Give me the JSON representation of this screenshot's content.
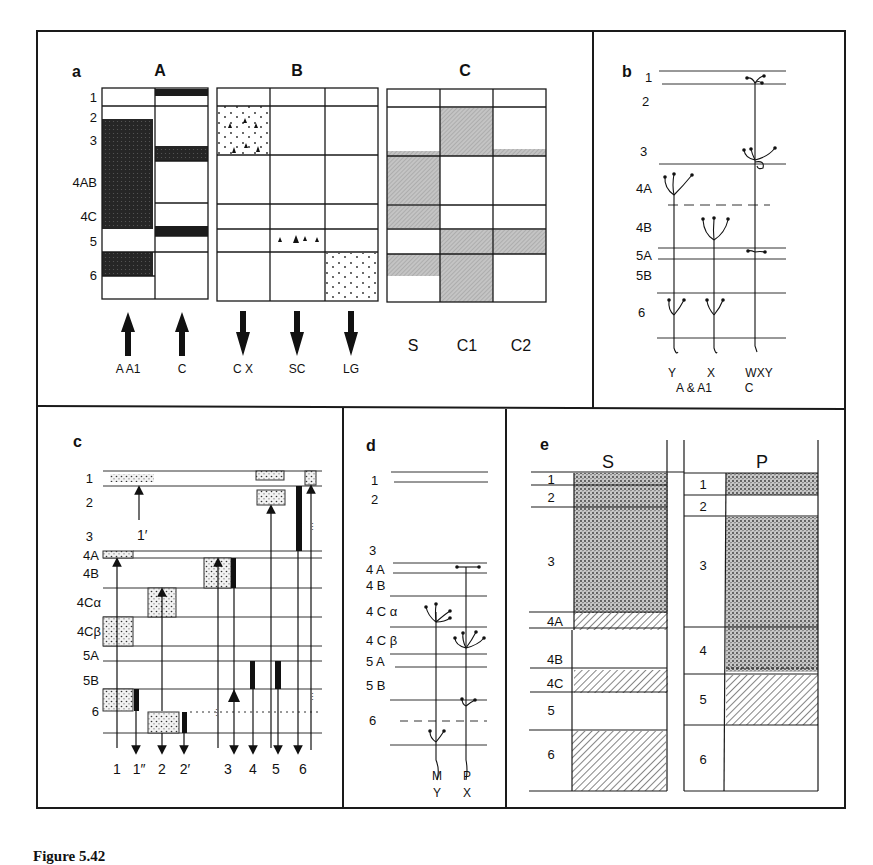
{
  "figure": {
    "caption": "Figure 5.42",
    "stroke_color": "#1a1a1a",
    "dark_fill": "#1c1c1c",
    "grey_fill": "#b8b8b8",
    "stipple_fill": "#e6e6e6"
  },
  "panel_a": {
    "letter": "a",
    "groups": [
      {
        "title": "A",
        "columns": [
          "A A1",
          "C"
        ],
        "arrow": "up"
      },
      {
        "title": "B",
        "columns": [
          "C X",
          "SC",
          "LG"
        ],
        "arrow": "down"
      },
      {
        "title": "C",
        "columns": [
          "S",
          "C1",
          "C2"
        ],
        "arrow": "none"
      }
    ],
    "layers": [
      "1",
      "2",
      "3",
      "4AB",
      "4C",
      "5",
      "6"
    ],
    "arrow_labels": {
      "A": [
        "A A1",
        "C"
      ],
      "B": [
        "C X",
        "SC",
        "LG"
      ],
      "C": [
        "S",
        "C1",
        "C2"
      ]
    }
  },
  "panel_b": {
    "letter": "b",
    "layers": [
      "1",
      "2",
      "3",
      "4A",
      "4B",
      "5A",
      "5B",
      "6"
    ],
    "lineages": [
      {
        "top": "Y",
        "bottom": "A & A1"
      },
      {
        "top": "X",
        "bottom": ""
      },
      {
        "top": "WXY",
        "bottom": "C"
      }
    ],
    "bottom_labels": [
      "Y",
      "X",
      "WXY",
      "A & A1",
      "C"
    ]
  },
  "panel_c": {
    "letter": "c",
    "layers": [
      "1",
      "2",
      "3",
      "4A",
      "4B",
      "4Cα",
      "4Cβ",
      "5A",
      "5B",
      "6"
    ],
    "marker": "1′",
    "columns": [
      "1",
      "1″",
      "2",
      "2′",
      "3",
      "4",
      "5",
      "6"
    ]
  },
  "panel_d": {
    "letter": "d",
    "layers": [
      "1",
      "2",
      "3",
      "4 A",
      "4 B",
      "4 C α",
      "4 C β",
      "5 A",
      "5 B",
      "6"
    ],
    "lineages": [
      {
        "top": "M",
        "bottom": "Y"
      },
      {
        "top": "P",
        "bottom": "X"
      }
    ]
  },
  "panel_e": {
    "letter": "e",
    "sections": [
      {
        "title": "S",
        "layers": [
          "1",
          "2",
          "3",
          "4A",
          "4B",
          "4C",
          "5",
          "6"
        ]
      },
      {
        "title": "P",
        "layers": [
          "1",
          "2",
          "3",
          "4",
          "5",
          "6"
        ]
      }
    ]
  }
}
